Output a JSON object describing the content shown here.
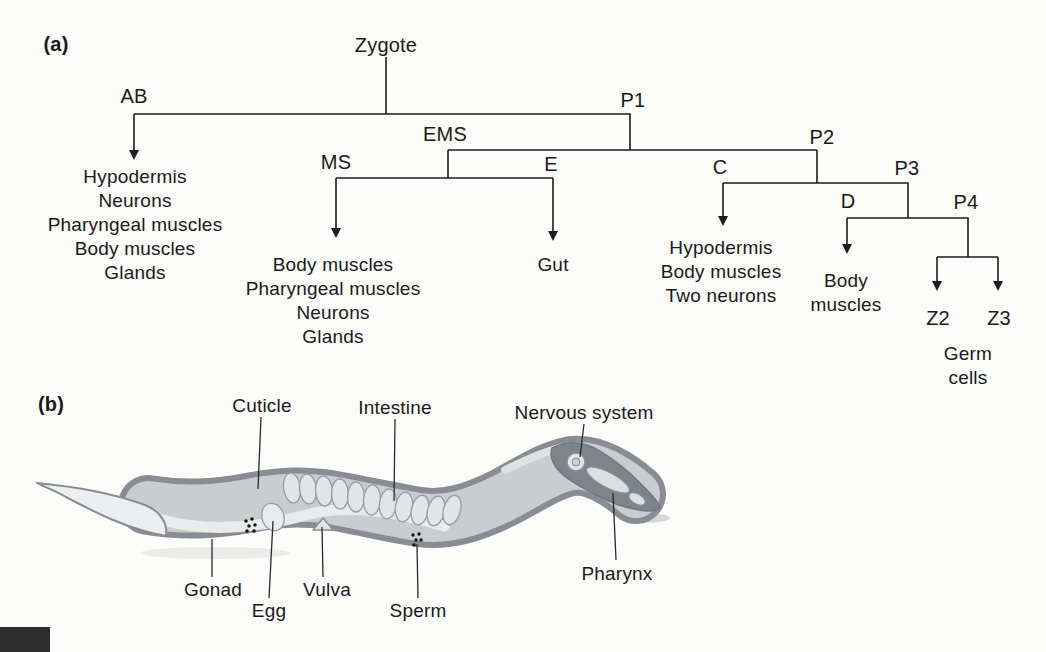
{
  "figure": {
    "panel_a": "(a)",
    "panel_b": "(b)"
  },
  "lineage": {
    "root": "Zygote",
    "nodes": {
      "ab": "AB",
      "p1": "P1",
      "ems": "EMS",
      "p2": "P2",
      "ms": "MS",
      "e": "E",
      "c": "C",
      "p3": "P3",
      "d": "D",
      "p4": "P4",
      "z2": "Z2",
      "z3": "Z3"
    },
    "fates": {
      "ab": "Hypodermis\nNeurons\nPharyngeal muscles\nBody muscles\nGlands",
      "ms": "Body muscles\nPharyngeal muscles\nNeurons\nGlands",
      "e": "Gut",
      "c": "Hypodermis\nBody muscles\nTwo neurons",
      "d": "Body\nmuscles",
      "z": "Germ\ncells"
    }
  },
  "anatomy": {
    "cuticle": "Cuticle",
    "intestine": "Intestine",
    "nervous_system": "Nervous system",
    "gonad": "Gonad",
    "egg": "Egg",
    "vulva": "Vulva",
    "sperm": "Sperm",
    "pharynx": "Pharynx"
  },
  "colors": {
    "ink": "#1d1d1d",
    "worm_outline": "#878d92",
    "worm_body": "#c9cdd0",
    "worm_light": "#e9ebec",
    "organ_fill": "#e2e5e7",
    "organ_stroke": "#9aa0a5",
    "head_dark": "#7d848a",
    "corner_box": "#2d2d2d",
    "background": "#fcfcfa"
  }
}
